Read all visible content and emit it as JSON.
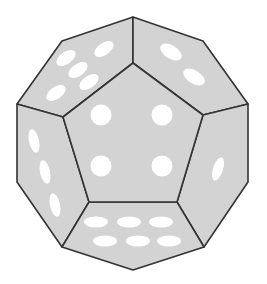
{
  "figure": {
    "colors": {
      "face": "#d3d3d3",
      "edge": "#333333",
      "pip": "#ffffff",
      "background": "#ffffff"
    },
    "visible_faces": [
      {
        "id": "front",
        "pips": 4
      },
      {
        "id": "upper-left",
        "pips": 5
      },
      {
        "id": "upper-right",
        "pips": 2
      },
      {
        "id": "left",
        "pips": 3
      },
      {
        "id": "right",
        "pips": 1
      },
      {
        "id": "bottom",
        "pips": 6
      }
    ]
  }
}
